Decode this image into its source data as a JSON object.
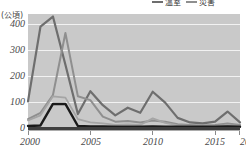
{
  "chart_data": {
    "type": "line",
    "title": "",
    "subtitle": "",
    "xlabel": "",
    "ylabel": "(公頃)",
    "yunit": "(公頃)",
    "grid": true,
    "legend_position": "top-right",
    "xlim": [
      2000,
      2017
    ],
    "ylim": [
      0,
      450
    ],
    "yticks": [
      0,
      100,
      200,
      300,
      400
    ],
    "ytick_labels": [
      "0",
      "100",
      "200",
      "300",
      "400"
    ],
    "xticks": [
      2000,
      2005,
      2010,
      2015,
      2017
    ],
    "xtick_labels": [
      "2000",
      "2005",
      "2010",
      "2015",
      "2017"
    ],
    "x": [
      2000,
      2001,
      2002,
      2003,
      2004,
      2005,
      2006,
      2007,
      2008,
      2009,
      2010,
      2011,
      2012,
      2013,
      2014,
      2015,
      2016,
      2017
    ],
    "series": [
      {
        "name": "溫室",
        "color": "#6e6e6e",
        "width": 2.2,
        "values": [
          105,
          400,
          440,
          250,
          55,
          145,
          90,
          50,
          80,
          60,
          143,
          100,
          40,
          22,
          18,
          25,
          65,
          22
        ]
      },
      {
        "name": "災害",
        "color": "#8f8f8f",
        "width": 2.0,
        "values": [
          35,
          60,
          130,
          375,
          125,
          110,
          45,
          25,
          28,
          22,
          30,
          25,
          15,
          12,
          10,
          12,
          18,
          12
        ]
      },
      {
        "name": "series-3",
        "color": "#a5a5a5",
        "width": 1.8,
        "values": [
          30,
          50,
          125,
          120,
          35,
          22,
          18,
          12,
          14,
          12,
          38,
          20,
          10,
          8,
          7,
          8,
          10,
          8
        ]
      },
      {
        "name": "series-4",
        "color": "#1a1a1a",
        "width": 2.4,
        "values": [
          8,
          10,
          95,
          95,
          8,
          6,
          6,
          5,
          5,
          5,
          6,
          5,
          5,
          5,
          5,
          5,
          6,
          5
        ]
      }
    ]
  },
  "legend": {
    "items": [
      {
        "label": "溫室",
        "color": "#6e6e6e"
      },
      {
        "label": "災害",
        "color": "#8f8f8f"
      }
    ]
  },
  "axis": {
    "unit_label": "(公頃)"
  }
}
